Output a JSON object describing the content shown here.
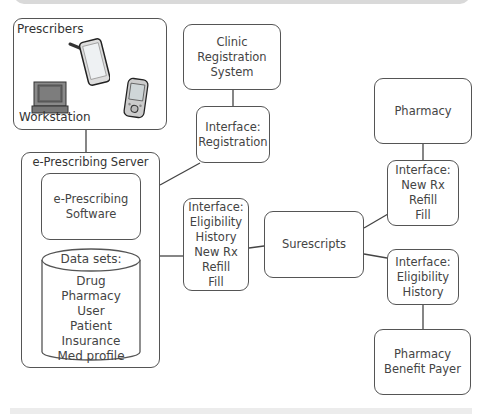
{
  "diagram": {
    "prescribers": {
      "title": "Prescribers",
      "workstation_label": "Workstation",
      "devices": [
        "tablet-icon",
        "pda-icon",
        "computer-workstation-icon"
      ]
    },
    "server": {
      "title": "e-Prescribing Server",
      "software": [
        "e-Prescribing",
        "Software"
      ],
      "datasets": {
        "title": "Data sets:",
        "items": [
          "Drug",
          "Pharmacy",
          "User",
          "Patient",
          "Insurance",
          "Med profile"
        ]
      }
    },
    "clinic_registration": [
      "Clinic Registration",
      "System"
    ],
    "interface_registration": [
      "Interface:",
      "Registration"
    ],
    "interface_server": [
      "Interface:",
      "Eligibility",
      "History",
      "New Rx",
      "Refill",
      "Fill"
    ],
    "surescripts": "Surescripts",
    "pharmacy": "Pharmacy",
    "interface_pharmacy": [
      "Interface:",
      "New Rx",
      "Refill",
      "Fill"
    ],
    "interface_payer": [
      "Interface:",
      "Eligibility",
      "History"
    ],
    "payer": [
      "Pharmacy",
      "Benefit Payer"
    ]
  },
  "colors": {
    "stroke": "#555555",
    "text": "#444444",
    "topbar": "#d9d9d9"
  }
}
